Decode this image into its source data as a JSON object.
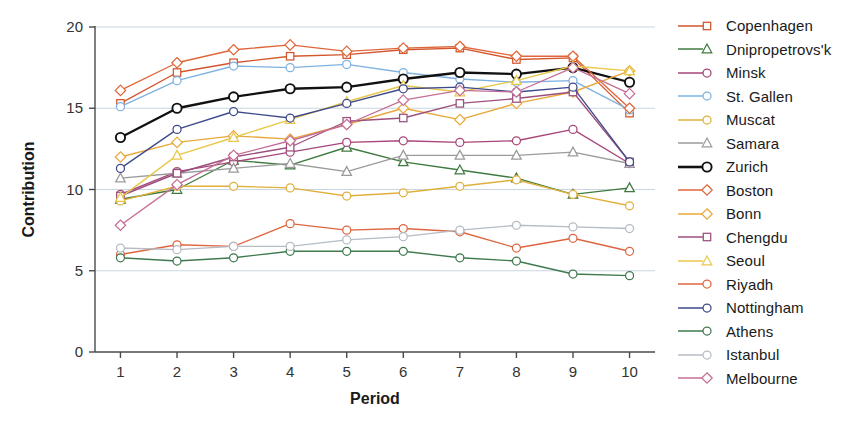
{
  "chart_data": {
    "type": "line",
    "title": "",
    "xlabel": "Period",
    "ylabel": "Contribution",
    "x": [
      1,
      2,
      3,
      4,
      5,
      6,
      7,
      8,
      9,
      10
    ],
    "xtick_labels": [
      "1",
      "2",
      "3",
      "4",
      "5",
      "6",
      "7",
      "8",
      "9",
      "10"
    ],
    "ytick_labels": [
      "0",
      "5",
      "10",
      "15",
      "20"
    ],
    "yticks": [
      0,
      5,
      10,
      15,
      20
    ],
    "xlim": [
      0.55,
      10.45
    ],
    "ylim": [
      0,
      20
    ],
    "grid": "horizontal",
    "legend_position": "right",
    "series": [
      {
        "name": "Copenhagen",
        "color": "#d2552c",
        "marker": "square",
        "values": [
          15.3,
          17.2,
          17.8,
          18.2,
          18.3,
          18.6,
          18.7,
          18.0,
          18.1,
          14.7
        ]
      },
      {
        "name": "Dnipropetrovs'k",
        "color": "#3f7a3f",
        "marker": "triangle",
        "values": [
          9.4,
          10.0,
          11.8,
          11.5,
          12.6,
          11.7,
          11.2,
          10.7,
          9.7,
          10.1
        ]
      },
      {
        "name": "Minsk",
        "color": "#a8457a",
        "marker": "circle",
        "values": [
          9.7,
          11.1,
          11.7,
          12.3,
          12.9,
          13.0,
          12.9,
          13.0,
          13.7,
          11.6
        ]
      },
      {
        "name": "St. Gallen",
        "color": "#7fb2e0",
        "marker": "circle",
        "values": [
          15.1,
          16.7,
          17.6,
          17.5,
          17.7,
          17.2,
          16.8,
          16.6,
          16.7,
          14.9
        ]
      },
      {
        "name": "Muscat",
        "color": "#e0b03c",
        "marker": "circle",
        "values": [
          9.3,
          10.2,
          10.2,
          10.1,
          9.6,
          9.8,
          10.2,
          10.6,
          9.7,
          9.0
        ]
      },
      {
        "name": "Samara",
        "color": "#9b9b9b",
        "marker": "triangle",
        "values": [
          10.7,
          11.0,
          11.3,
          11.6,
          11.1,
          12.1,
          12.1,
          12.1,
          12.3,
          11.6
        ]
      },
      {
        "name": "Zurich",
        "color": "#111111",
        "marker": "circle",
        "values": [
          13.2,
          15.0,
          15.7,
          16.2,
          16.3,
          16.8,
          17.2,
          17.1,
          17.5,
          16.6
        ]
      },
      {
        "name": "Boston",
        "color": "#e0663a",
        "marker": "diamond",
        "values": [
          16.1,
          17.8,
          18.6,
          18.9,
          18.5,
          18.7,
          18.8,
          18.2,
          18.2,
          15.0
        ]
      },
      {
        "name": "Bonn",
        "color": "#e8a93a",
        "marker": "diamond",
        "values": [
          12.0,
          12.9,
          13.3,
          13.1,
          14.0,
          15.0,
          14.3,
          15.3,
          16.0,
          17.3
        ]
      },
      {
        "name": "Chengdu",
        "color": "#9c4f7c",
        "marker": "square",
        "values": [
          9.6,
          11.0,
          12.0,
          12.6,
          14.2,
          14.4,
          15.3,
          15.6,
          16.0,
          11.7
        ]
      },
      {
        "name": "Seoul",
        "color": "#e8c84a",
        "marker": "triangle",
        "values": [
          9.5,
          12.1,
          13.2,
          14.3,
          15.4,
          16.4,
          16.0,
          16.7,
          17.6,
          17.3
        ]
      },
      {
        "name": "Riyadh",
        "color": "#dd6640",
        "marker": "circle",
        "values": [
          6.0,
          6.6,
          6.5,
          7.9,
          7.5,
          7.6,
          7.4,
          6.4,
          7.0,
          6.2
        ]
      },
      {
        "name": "Nottingham",
        "color": "#3f4a8c",
        "marker": "circle",
        "values": [
          11.3,
          13.7,
          14.8,
          14.4,
          15.3,
          16.2,
          16.3,
          16.0,
          16.3,
          11.7
        ]
      },
      {
        "name": "Athens",
        "color": "#3f7a4f",
        "marker": "circle",
        "values": [
          5.8,
          5.6,
          5.8,
          6.2,
          6.2,
          6.2,
          5.8,
          5.6,
          4.8,
          4.7
        ]
      },
      {
        "name": "Istanbul",
        "color": "#b5bcc4",
        "marker": "circle",
        "values": [
          6.4,
          6.3,
          6.5,
          6.5,
          6.9,
          7.1,
          7.5,
          7.8,
          7.7,
          7.6
        ]
      },
      {
        "name": "Melbourne",
        "color": "#c46f96",
        "marker": "diamond",
        "values": [
          7.8,
          10.3,
          12.1,
          13.0,
          14.0,
          15.5,
          16.1,
          16.0,
          17.5,
          15.9
        ]
      }
    ]
  }
}
